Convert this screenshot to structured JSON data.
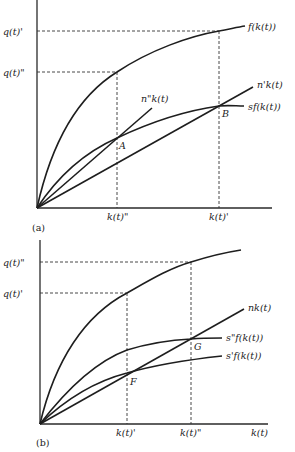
{
  "panels": {
    "a": {
      "tag": "(a)",
      "y_labels": {
        "q_prime": "q(t)'",
        "q_dprime": "q(t)\""
      },
      "x_labels": {
        "k_dprime": "k(t)\"",
        "k_prime": "k(t)'"
      },
      "curves": {
        "f": "f(k(t))",
        "n_prime": "n'k(t)",
        "n_dprime": "n\"k(t)",
        "sf": "sf(k(t))"
      },
      "points": {
        "A": "A",
        "B": "B"
      }
    },
    "b": {
      "tag": "(b)",
      "y_labels": {
        "q_dprime": "q(t)\"",
        "q_prime": "q(t)'"
      },
      "x_labels": {
        "k_prime": "k(t)'",
        "k_dprime": "k(t)\"",
        "k": "k(t)"
      },
      "curves": {
        "nk": "nk(t)",
        "s_dprime_f": "s\"f(k(t))",
        "s_prime_f": "s'f(k(t))"
      },
      "points": {
        "F": "F",
        "G": "G"
      }
    }
  }
}
